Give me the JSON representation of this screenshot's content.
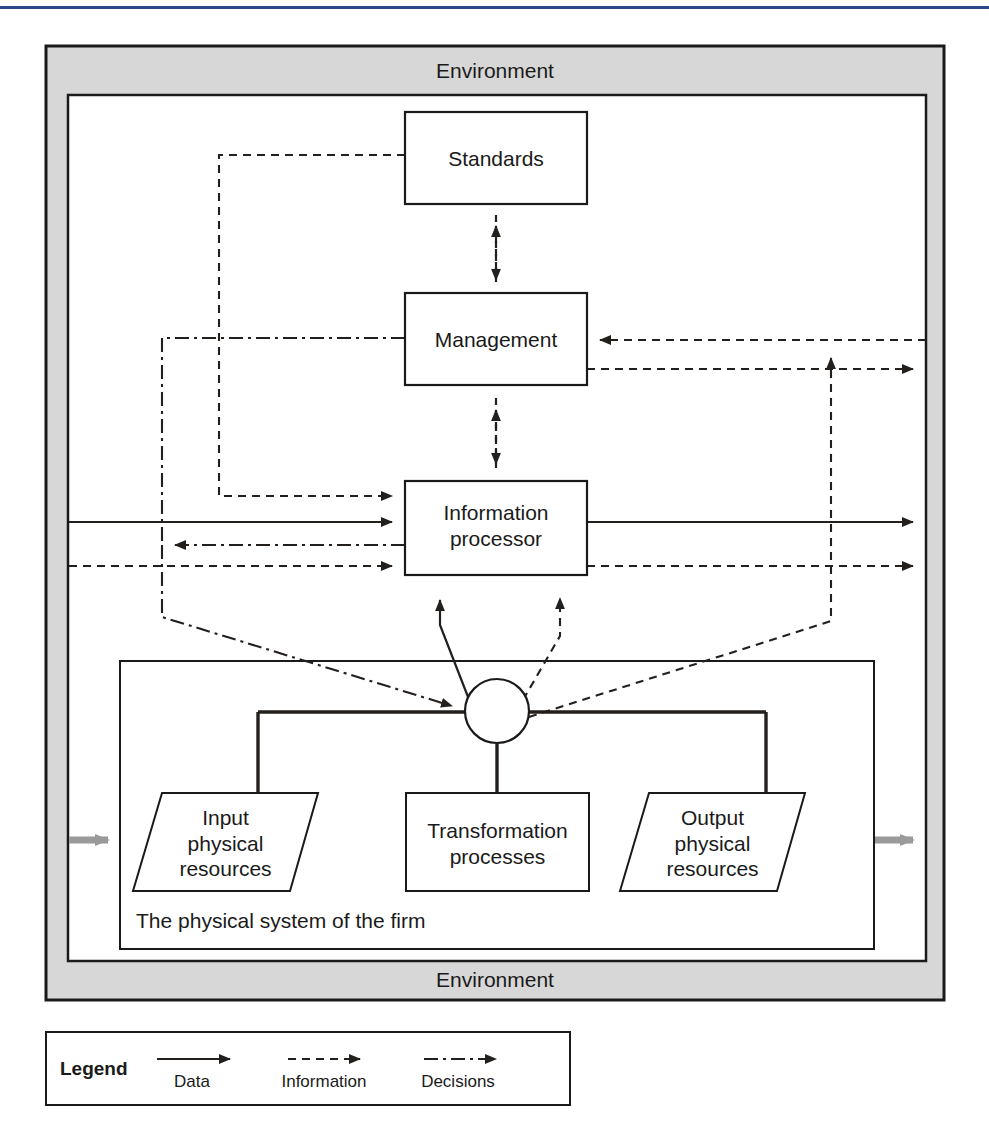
{
  "diagram": {
    "type": "general-systems-model-of-the-firm",
    "environment_top_label": "Environment",
    "environment_bottom_label": "Environment",
    "physical_system_label": "The physical system of the firm",
    "boxes": [
      {
        "id": "standards",
        "label": "Standards",
        "shape": "rect",
        "x": 405,
        "y": 112,
        "w": 182,
        "h": 92
      },
      {
        "id": "management",
        "label": "Management",
        "shape": "rect",
        "x": 405,
        "y": 293,
        "w": 182,
        "h": 92
      },
      {
        "id": "information-processor",
        "label": "Information\nprocessor",
        "line1": "Information",
        "line2": "processor",
        "shape": "rect",
        "x": 405,
        "y": 481,
        "w": 182,
        "h": 94
      },
      {
        "id": "input-physical-resources",
        "label": "Input physical resources",
        "line1": "Input",
        "line2": "physical",
        "line3": "resources",
        "shape": "parallelogram",
        "x": 133,
        "y": 793,
        "w": 185,
        "h": 98
      },
      {
        "id": "transformation-processes",
        "label": "Transformation processes",
        "line1": "Transformation",
        "line2": "processes",
        "shape": "rect",
        "x": 406,
        "y": 793,
        "w": 183,
        "h": 98
      },
      {
        "id": "output-physical-resources",
        "label": "Output physical resources",
        "line1": "Output",
        "line2": "physical",
        "line3": "resources",
        "shape": "parallelogram",
        "x": 620,
        "y": 793,
        "w": 185,
        "h": 98
      }
    ],
    "junction": {
      "id": "system-junction",
      "shape": "circle",
      "cx": 497,
      "cy": 711,
      "r": 32
    }
  },
  "legend": {
    "title": "Legend",
    "items": [
      {
        "id": "data",
        "label": "Data",
        "style": "solid"
      },
      {
        "id": "information",
        "label": "Information",
        "style": "dashed"
      },
      {
        "id": "decisions",
        "label": "Decisions",
        "style": "dash-dot"
      }
    ]
  },
  "colors": {
    "environment_fill": "#d7d7d7",
    "stroke": "#1a1a1a",
    "box_fill": "#ffffff",
    "physical_flow": "#9a9a9a",
    "rule": "#2e4a8a"
  }
}
